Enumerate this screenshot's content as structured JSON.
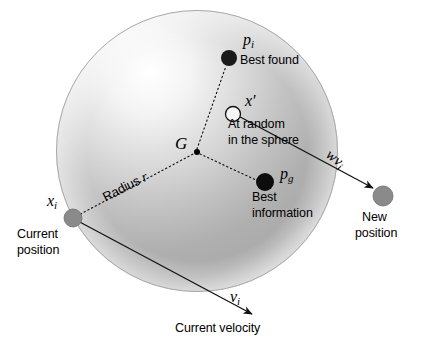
{
  "figure": {
    "type": "concept-diagram",
    "background_color": "#ffffff",
    "ink_color": "#000000"
  },
  "sphere": {
    "name": "search-sphere",
    "center": {
      "x": 197,
      "y": 151
    },
    "radius": 141,
    "fill_light": "#fdfdfd",
    "fill_mid": "#b9b9b9",
    "fill_dark": "#8f8f8f",
    "outline_color": "#b0b0b0"
  },
  "points": [
    {
      "id": "p_i",
      "name": "best-found-point",
      "symbol": "p",
      "subscript": "i",
      "caption": "Best found",
      "x": 229,
      "y": 58,
      "r": 8,
      "fill": "#1a1a1a",
      "style": "filled"
    },
    {
      "id": "x_prime",
      "name": "random-point",
      "symbol": "x",
      "subscript": "",
      "prime": "′",
      "caption": "At random in the sphere",
      "caption_line_1": "At random",
      "caption_line_2": "in the sphere",
      "x": 233,
      "y": 114,
      "r": 7.5,
      "fill": "#ffffff",
      "style": "hollow"
    },
    {
      "id": "G",
      "name": "centre-of-gravity-point",
      "symbol": "G",
      "subscript": "",
      "caption": "",
      "x": 197,
      "y": 152,
      "r": 3,
      "fill": "#000000",
      "style": "filled"
    },
    {
      "id": "p_g",
      "name": "best-information-point",
      "symbol": "p",
      "subscript": "g",
      "caption": "Best information",
      "caption_line_1": "Best",
      "caption_line_2": "information",
      "x": 265,
      "y": 182,
      "r": 9,
      "fill": "#0d0d0d",
      "style": "filled"
    },
    {
      "id": "x_i",
      "name": "current-position-point",
      "symbol": "x",
      "subscript": "i",
      "caption": "Current position",
      "caption_line_1": "Current",
      "caption_line_2": "position",
      "x": 73,
      "y": 218,
      "r": 9,
      "fill": "#8a8a8a",
      "style": "filled-gray"
    },
    {
      "id": "new_position",
      "name": "new-position-point",
      "symbol": "",
      "subscript": "",
      "caption": "New position",
      "caption_line_1": "New",
      "caption_line_2": "position",
      "x": 383,
      "y": 196,
      "r": 10,
      "fill": "#8a8a8a",
      "style": "filled-gray"
    }
  ],
  "connectors": [
    {
      "name": "radius-line-xi-to-G",
      "style": "dotted",
      "from": "x_i",
      "to": "G",
      "label": "Radius r",
      "label_symbol": "r"
    },
    {
      "name": "spoke-G-to-pi",
      "style": "dotted",
      "from": "G",
      "to": "p_i",
      "label": ""
    },
    {
      "name": "spoke-G-to-pg",
      "style": "dotted",
      "from": "G",
      "to": "p_g",
      "label": ""
    }
  ],
  "vectors": [
    {
      "name": "velocity-vector",
      "label": "v",
      "subscript": "i",
      "caption": "Current velocity",
      "from": {
        "x": 73,
        "y": 218
      },
      "to": {
        "x": 252,
        "y": 314
      },
      "arrowhead": true
    },
    {
      "name": "weighted-velocity-vector",
      "label": "wv",
      "subscript": "i",
      "caption": "",
      "from": {
        "x": 233,
        "y": 114
      },
      "to": {
        "x": 372,
        "y": 188
      },
      "arrowhead": true
    }
  ],
  "labels": {
    "best_found": "Best found",
    "at_random_1": "At random",
    "at_random_2": "in the sphere",
    "best_1": "Best",
    "best_2": "information",
    "current_pos_1": "Current",
    "current_pos_2": "position",
    "new_pos_1": "New",
    "new_pos_2": "position",
    "current_velocity": "Current velocity",
    "radius_word": "Radius",
    "radius_symbol": "r",
    "G": "G",
    "p": "p",
    "x": "x",
    "v": "v",
    "w": "w",
    "sub_i": "i",
    "sub_g": "g",
    "prime": "′"
  }
}
